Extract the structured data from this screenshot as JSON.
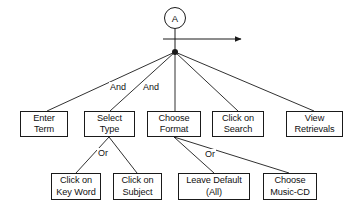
{
  "diagram": {
    "root": {
      "id": "A",
      "label": "A"
    },
    "flow_arrow": {
      "name": "sequence-arrow",
      "direction": "right"
    },
    "junction": {
      "name": "and-junction-dot"
    },
    "level1_nodes": [
      {
        "id": "enter-term",
        "lines": [
          "Enter",
          "Term"
        ]
      },
      {
        "id": "select-type",
        "lines": [
          "Select",
          "Type"
        ]
      },
      {
        "id": "choose-format",
        "lines": [
          "Choose",
          "Format"
        ]
      },
      {
        "id": "click-on-search",
        "lines": [
          "Click on",
          "Search"
        ]
      },
      {
        "id": "view-retrievals",
        "lines": [
          "View",
          "Retrievals"
        ]
      }
    ],
    "level2_nodes": [
      {
        "id": "click-on-key-word",
        "lines": [
          "Click on",
          "Key Word"
        ]
      },
      {
        "id": "click-on-subject",
        "lines": [
          "Click on",
          "Subject"
        ]
      },
      {
        "id": "leave-default-all",
        "lines": [
          "Leave Default",
          "(All)"
        ]
      },
      {
        "id": "choose-music-cd",
        "lines": [
          "Choose",
          "Music-CD"
        ]
      }
    ],
    "edge_labels": [
      {
        "id": "and-1",
        "text": "And"
      },
      {
        "id": "and-2",
        "text": "And"
      },
      {
        "id": "or-1",
        "text": "Or"
      },
      {
        "id": "or-2",
        "text": "Or"
      }
    ],
    "colors": {
      "stroke": "#1a1a1a",
      "text": "#111111",
      "background": "#ffffff"
    }
  }
}
